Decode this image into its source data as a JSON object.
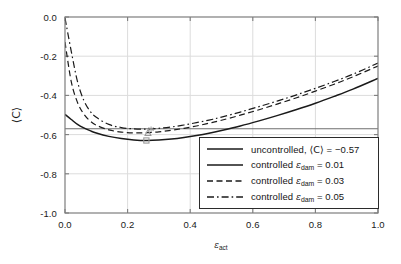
{
  "chart_data": {
    "type": "line",
    "title": "",
    "xlabel": "ε_act",
    "ylabel": "⟨C⟩",
    "xlim": [
      0.0,
      1.0
    ],
    "ylim": [
      -1.0,
      0.0
    ],
    "xticks": [
      "0.0",
      "0.2",
      "0.4",
      "0.6",
      "0.8",
      "1.0"
    ],
    "yticks": [
      "0.0",
      "-0.2",
      "-0.4",
      "-0.6",
      "-0.8",
      "-1.0"
    ],
    "grid": true,
    "legend_position": "lower-right-inside",
    "series": [
      {
        "name": "uncontrolled, ⟨C⟩ = −0.57",
        "style": "solid-thin",
        "color": "#6e6e6e",
        "constant_value": -0.57,
        "x": [
          0.0,
          1.0
        ],
        "values": [
          -0.57,
          -0.57
        ]
      },
      {
        "name": "controlled ε_dam = 0.01",
        "style": "solid-thick",
        "color": "#1a1a1a",
        "x": [
          0.0,
          0.02,
          0.04,
          0.06,
          0.08,
          0.1,
          0.14,
          0.18,
          0.22,
          0.26,
          0.3,
          0.34,
          0.38,
          0.42,
          0.46,
          0.5,
          0.56,
          0.62,
          0.68,
          0.74,
          0.8,
          0.86,
          0.92,
          1.0
        ],
        "values": [
          -0.497,
          -0.523,
          -0.548,
          -0.566,
          -0.58,
          -0.592,
          -0.609,
          -0.62,
          -0.627,
          -0.63,
          -0.628,
          -0.623,
          -0.615,
          -0.605,
          -0.593,
          -0.579,
          -0.556,
          -0.53,
          -0.502,
          -0.472,
          -0.44,
          -0.405,
          -0.368,
          -0.313
        ]
      },
      {
        "name": "controlled ε_dam = 0.03",
        "style": "dashed",
        "color": "#1a1a1a",
        "x": [
          0.0,
          0.02,
          0.04,
          0.06,
          0.08,
          0.1,
          0.14,
          0.18,
          0.22,
          0.26,
          0.3,
          0.34,
          0.38,
          0.42,
          0.46,
          0.5,
          0.56,
          0.62,
          0.68,
          0.74,
          0.8,
          0.86,
          0.92,
          1.0
        ],
        "values": [
          -0.128,
          -0.33,
          -0.436,
          -0.495,
          -0.53,
          -0.552,
          -0.576,
          -0.587,
          -0.591,
          -0.59,
          -0.586,
          -0.578,
          -0.568,
          -0.556,
          -0.542,
          -0.527,
          -0.501,
          -0.473,
          -0.443,
          -0.412,
          -0.378,
          -0.343,
          -0.305,
          -0.25
        ]
      },
      {
        "name": "controlled ε_dam = 0.05",
        "style": "dash-dot",
        "color": "#1a1a1a",
        "x": [
          0.0,
          0.02,
          0.04,
          0.06,
          0.08,
          0.1,
          0.14,
          0.18,
          0.22,
          0.26,
          0.3,
          0.34,
          0.38,
          0.42,
          0.46,
          0.5,
          0.56,
          0.62,
          0.68,
          0.74,
          0.8,
          0.86,
          0.92,
          1.0
        ],
        "values": [
          -0.005,
          -0.175,
          -0.33,
          -0.425,
          -0.48,
          -0.512,
          -0.548,
          -0.564,
          -0.571,
          -0.572,
          -0.568,
          -0.561,
          -0.551,
          -0.539,
          -0.526,
          -0.511,
          -0.485,
          -0.457,
          -0.428,
          -0.397,
          -0.364,
          -0.329,
          -0.292,
          -0.235
        ]
      }
    ],
    "minima_markers": [
      {
        "series": "controlled ε_dam = 0.01",
        "x": 0.26,
        "y": -0.63,
        "marker": "square",
        "color": "#9a9a9a"
      },
      {
        "series": "controlled ε_dam = 0.03",
        "x": 0.265,
        "y": -0.591,
        "marker": "triangle",
        "color": "#9a9a9a"
      },
      {
        "series": "controlled ε_dam = 0.05",
        "x": 0.275,
        "y": -0.572,
        "marker": "asterisk",
        "color": "#9a9a9a"
      }
    ]
  },
  "axes": {
    "xlabel_base": "ε",
    "xlabel_sub": "act",
    "ylabel": "⟨C⟩",
    "xticks": [
      "0.0",
      "0.2",
      "0.4",
      "0.6",
      "0.8",
      "1.0"
    ],
    "yticks": [
      "0.0",
      "-0.2",
      "-0.4",
      "-0.6",
      "-0.8",
      "-1.0"
    ]
  },
  "legend": {
    "entries": [
      {
        "prefix": "uncontrolled, ",
        "symbol": "⟨C⟩",
        "relation": " = −0.57",
        "sub": "",
        "style": "solid-thin"
      },
      {
        "prefix": "controlled ",
        "symbol": "ε",
        "sub": "dam",
        "relation": " = 0.01",
        "style": "solid-thick"
      },
      {
        "prefix": "controlled ",
        "symbol": "ε",
        "sub": "dam",
        "relation": " = 0.03",
        "style": "dashed"
      },
      {
        "prefix": "controlled ",
        "symbol": "ε",
        "sub": "dam",
        "relation": " = 0.05",
        "style": "dash-dot"
      }
    ]
  },
  "colors": {
    "frame": "#7d7d7d",
    "grid": "#dcdcdc",
    "curve": "#1a1a1a",
    "reference": "#6e6e6e",
    "marker": "#9a9a9a",
    "background": "#ffffff"
  }
}
